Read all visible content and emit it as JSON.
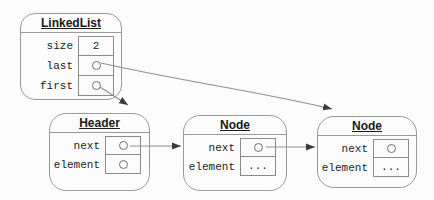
{
  "diagram": {
    "type": "uml-object-diagram",
    "boxes": {
      "linkedlist": {
        "title": "LinkedList",
        "rows": [
          {
            "label": "size",
            "value": "2"
          },
          {
            "label": "last",
            "value": "pointer"
          },
          {
            "label": "first",
            "value": "pointer"
          }
        ]
      },
      "header": {
        "title": "Header",
        "rows": [
          {
            "label": "next",
            "value": "pointer"
          },
          {
            "label": "element",
            "value": "pointer"
          }
        ]
      },
      "node1": {
        "title": "Node",
        "rows": [
          {
            "label": "next",
            "value": "pointer"
          },
          {
            "label": "element",
            "value": "..."
          }
        ]
      },
      "node2": {
        "title": "Node",
        "rows": [
          {
            "label": "next",
            "value": "pointer"
          },
          {
            "label": "element",
            "value": "..."
          }
        ]
      }
    },
    "arrows": [
      {
        "from": "linkedlist.last",
        "to": "node2"
      },
      {
        "from": "linkedlist.first",
        "to": "header"
      },
      {
        "from": "header.next",
        "to": "node1"
      },
      {
        "from": "node1.next",
        "to": "node2"
      }
    ]
  },
  "colors": {
    "background": "#fcfcfc",
    "box_border": "#999999",
    "arrow_line": "#8f8f8f",
    "arrow_head": "#3c3c3c",
    "text": "#1c1c1c"
  }
}
